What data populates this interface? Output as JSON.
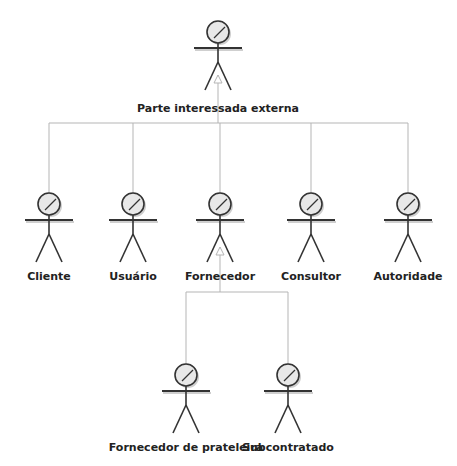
{
  "diagram": {
    "type": "uml-use-case-actor-generalization",
    "colors": {
      "background": "#ffffff",
      "connector": "#b5b5b5",
      "actor_stroke": "#333333",
      "head_fill": "#e8e8e8",
      "shadow": "#cfcfcf",
      "label": "#222222"
    },
    "actors": [
      {
        "id": "parte-interessada-externa",
        "label": "Parte interessada externa",
        "x": 218,
        "y": 32,
        "label_y": 102
      },
      {
        "id": "cliente",
        "label": "Cliente",
        "x": 49,
        "y": 204,
        "label_y": 270
      },
      {
        "id": "usuario",
        "label": "Usuário",
        "x": 133,
        "y": 204,
        "label_y": 270
      },
      {
        "id": "fornecedor",
        "label": "Fornecedor",
        "x": 220,
        "y": 204,
        "label_y": 270
      },
      {
        "id": "consultor",
        "label": "Consultor",
        "x": 311,
        "y": 204,
        "label_y": 270
      },
      {
        "id": "autoridade",
        "label": "Autoridade",
        "x": 408,
        "y": 204,
        "label_y": 270
      },
      {
        "id": "fornecedor-de-prateleira",
        "label": "Fornecedor de prateleira",
        "x": 186,
        "y": 375,
        "label_y": 441
      },
      {
        "id": "subcontratado",
        "label": "Subcontratado",
        "x": 288,
        "y": 375,
        "label_y": 441
      }
    ],
    "generalizations": [
      {
        "parent": "parte-interessada-externa",
        "children": [
          "cliente",
          "usuario",
          "fornecedor",
          "consultor",
          "autoridade"
        ],
        "bus_y": 123
      },
      {
        "parent": "fornecedor",
        "children": [
          "fornecedor-de-prateleira",
          "subcontratado"
        ],
        "bus_y": 292
      }
    ]
  }
}
